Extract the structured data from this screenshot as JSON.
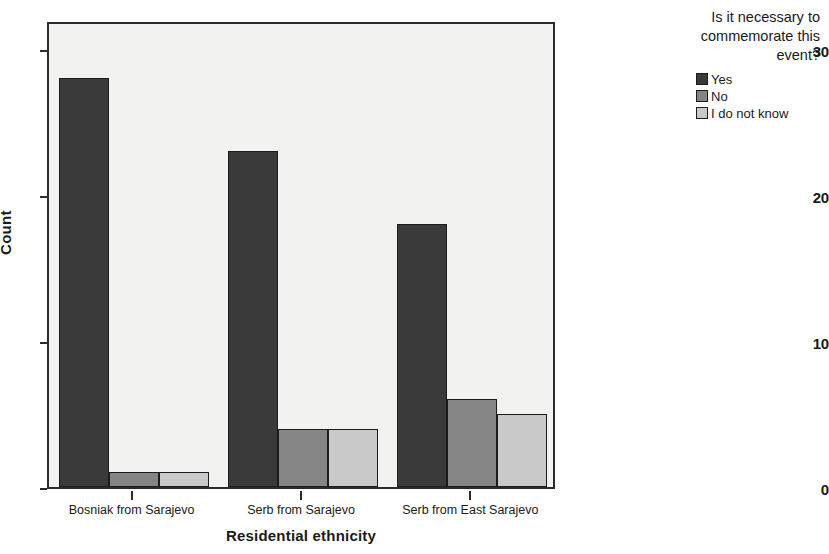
{
  "chart_data": {
    "type": "bar",
    "title": "",
    "xlabel": "Residential ethnicity",
    "ylabel": "Count",
    "categories": [
      "Bosniak from Sarajevo",
      "Serb from Sarajevo",
      "Serb from East Sarajevo"
    ],
    "series": [
      {
        "name": "Yes",
        "color": "#3a3a3a",
        "values": [
          28,
          23,
          18
        ]
      },
      {
        "name": "No",
        "color": "#858585",
        "values": [
          1,
          4,
          6
        ]
      },
      {
        "name": "I do not know",
        "color": "#c9c9c9",
        "values": [
          1,
          4,
          5
        ]
      }
    ],
    "ylim": [
      0,
      32
    ],
    "yticks": [
      0,
      10,
      20,
      30
    ],
    "ytick_labels": [
      "0",
      "10",
      "20",
      "30"
    ],
    "grid": false,
    "legend_position": "right",
    "legend_title": "Is it necessary to commemorate this event?",
    "plot_background": "#f2f2f0",
    "axis_color": "#2b2b2b"
  },
  "legend": {
    "title_lines": [
      "Is it necessary to",
      "commemorate this",
      "event?"
    ]
  }
}
